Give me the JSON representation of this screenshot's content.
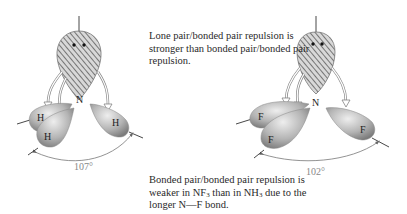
{
  "captions": {
    "lone_pair": "Lone pair/bonded pair repulsion is stronger than bonded pair/bonded pair repulsion.",
    "bonded_pair": {
      "part1": "Bonded pair/bonded pair repulsion is weaker in NF",
      "sub1": "3",
      "part2": " than in NH",
      "sub2": "3",
      "part3": " due to the longer N—F bond."
    }
  },
  "molecules": [
    {
      "name": "NH3",
      "central_atom": "N",
      "ligands": [
        "H",
        "H",
        "H"
      ],
      "bond_angle": "107°"
    },
    {
      "name": "NF3",
      "central_atom": "N",
      "ligands": [
        "F",
        "F",
        "F"
      ],
      "bond_angle": "102°"
    }
  ],
  "colors": {
    "lobe_dark": "#7a7a7a",
    "lobe_light": "#e4e4e4",
    "hatch": "#555555",
    "angle_arc": "#777777"
  }
}
